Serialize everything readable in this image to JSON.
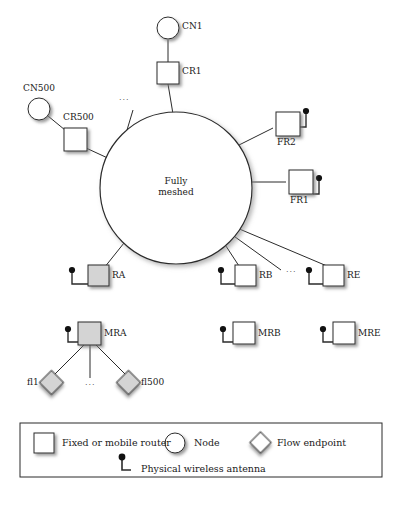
{
  "figure": {
    "center_circle": {
      "label_line1": "Fully",
      "label_line2": "meshed"
    },
    "core_nodes": [
      {
        "id": "cn1",
        "label": "CN1",
        "shape": "circle",
        "fill": "white"
      },
      {
        "id": "cr1",
        "label": "CR1",
        "shape": "square",
        "fill": "white"
      },
      {
        "id": "cn500",
        "label": "CN500",
        "shape": "circle",
        "fill": "white"
      },
      {
        "id": "cr500",
        "label": "CR500",
        "shape": "square",
        "fill": "white"
      }
    ],
    "fixed_routers": [
      {
        "id": "fr2",
        "label": "FR2",
        "shape": "square",
        "fill": "white",
        "antenna": "right"
      },
      {
        "id": "fr1",
        "label": "FR1",
        "shape": "square",
        "fill": "white",
        "antenna": "right"
      }
    ],
    "access_routers": [
      {
        "id": "ra",
        "label": "RA",
        "shape": "square",
        "fill": "gray",
        "antenna": "left"
      },
      {
        "id": "rb",
        "label": "RB",
        "shape": "square",
        "fill": "white",
        "antenna": "left"
      },
      {
        "id": "re",
        "label": "RE",
        "shape": "square",
        "fill": "white",
        "antenna": "left"
      }
    ],
    "mobile_routers": [
      {
        "id": "mra",
        "label": "MRA",
        "shape": "square",
        "fill": "gray",
        "antenna": "left"
      },
      {
        "id": "mrb",
        "label": "MRB",
        "shape": "square",
        "fill": "white",
        "antenna": "left"
      },
      {
        "id": "mre",
        "label": "MRE",
        "shape": "square",
        "fill": "white",
        "antenna": "left"
      }
    ],
    "flow_endpoints": [
      {
        "id": "fl1",
        "label": "fl1",
        "shape": "diamond",
        "fill": "gray"
      },
      {
        "id": "fl500",
        "label": "fl500",
        "shape": "diamond",
        "fill": "gray"
      }
    ],
    "ellipses": [
      {
        "id": "ellipsis-core",
        "label": "..."
      },
      {
        "id": "ellipsis-routers",
        "label": "..."
      },
      {
        "id": "ellipsis-flows",
        "label": "..."
      }
    ]
  },
  "legend": {
    "items": [
      {
        "id": "router",
        "icon": "square-icon",
        "label": "Fixed or mobile router"
      },
      {
        "id": "node",
        "icon": "circle-icon",
        "label": "Node"
      },
      {
        "id": "flow",
        "icon": "diamond-icon",
        "label": "Flow endpoint"
      },
      {
        "id": "antenna",
        "icon": "antenna-icon",
        "label": "Physical wireless antenna"
      }
    ]
  },
  "colors": {
    "stroke": "#2b2b2b",
    "gray_fill": "#d4d4d4",
    "white_fill": "#ffffff",
    "text": "#1a1a1a"
  }
}
